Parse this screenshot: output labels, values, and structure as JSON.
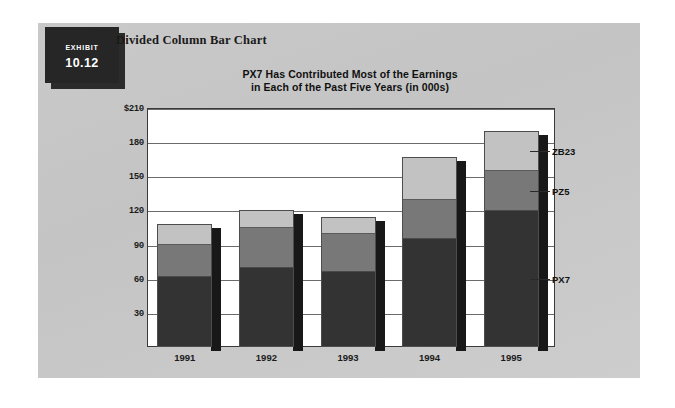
{
  "exhibit": {
    "tag_word": "Exhibit",
    "tag_number": "10.12",
    "heading": "Divided Column Bar Chart"
  },
  "chart_title_line1": "PX7 Has Contributed Most of the Earnings",
  "chart_title_line2": "in Each of the Past Five Years (in 000s)",
  "colors": {
    "panel_background": "#c7c7c7",
    "plot_background": "#ffffff",
    "px7": "#333333",
    "pz5": "#787878",
    "zb23": "#c2c2c2",
    "axis": "#3a3a3a",
    "gridline": "#6b6b6b",
    "shadow": "#181818",
    "tag_background": "#262626",
    "tag_text": "#ffffff"
  },
  "chart_data": {
    "type": "bar",
    "subtype": "stacked-column",
    "title": "PX7 Has Contributed Most of the Earnings in Each of the Past Five Years (in 000s)",
    "xlabel": "",
    "ylabel": "",
    "ylim": [
      0,
      210
    ],
    "ytick_step": 30,
    "ytick_labels": [
      "$210",
      "180",
      "150",
      "120",
      "90",
      "60",
      "30"
    ],
    "ytick_values": [
      210,
      180,
      150,
      120,
      90,
      60,
      30
    ],
    "grid": true,
    "legend_position": "right-callout",
    "categories": [
      "1991",
      "1992",
      "1993",
      "1994",
      "1995"
    ],
    "series": [
      {
        "name": "PX7",
        "color": "#333333",
        "values": [
          62,
          70,
          66,
          95,
          120
        ]
      },
      {
        "name": "PZ5",
        "color": "#787878",
        "values": [
          28,
          35,
          34,
          35,
          35
        ]
      },
      {
        "name": "ZB23",
        "color": "#c2c2c2",
        "values": [
          18,
          15,
          14,
          37,
          35
        ]
      }
    ],
    "totals": [
      108,
      120,
      114,
      167,
      190
    ]
  }
}
